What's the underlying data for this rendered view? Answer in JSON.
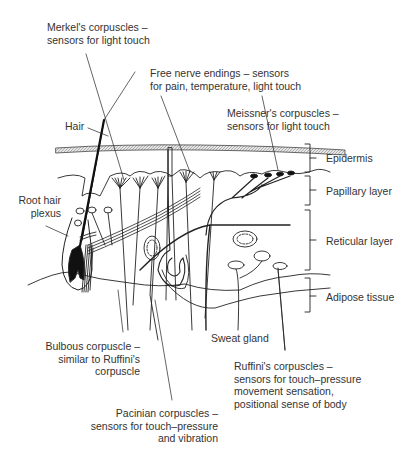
{
  "labels": {
    "merkel": {
      "line1": "Merkel's corpuscles –",
      "line2": "sensors for light touch"
    },
    "free_nerve": {
      "line1": "Free nerve endings – sensors",
      "line2": "for pain, temperature, light touch"
    },
    "meissner": {
      "line1": "Meissner's corpuscles –",
      "line2": "sensors for light touch"
    },
    "hair": "Hair",
    "root_hair": {
      "line1": "Root hair",
      "line2": "plexus"
    },
    "bulbous": {
      "line1": "Bulbous corpuscle –",
      "line2": "similar to Ruffini's",
      "line3": "corpuscle"
    },
    "sweat_gland": "Sweat gland",
    "ruffini": {
      "line1": "Ruffini's corpuscles –",
      "line2": "sensors for touch–pressure",
      "line3": "movement sensation,",
      "line4": "positional sense of body"
    },
    "pacinian": {
      "line1": "Pacinian corpuscles –",
      "line2": "sensors for touch–pressure",
      "line3": "and vibration"
    }
  },
  "layers": [
    {
      "name": "Epidermis"
    },
    {
      "name": "Papillary layer"
    },
    {
      "name": "Reticular layer"
    },
    {
      "name": "Adipose tissue"
    }
  ]
}
